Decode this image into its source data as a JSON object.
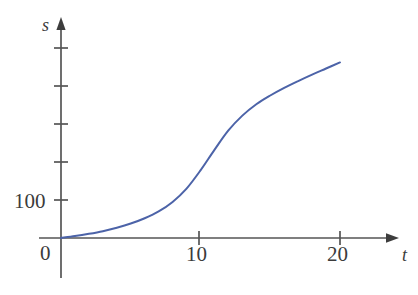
{
  "figure": {
    "background_color": "#ffffff",
    "width": 418,
    "height": 295
  },
  "axes": {
    "x_axis_name": "t",
    "y_axis_name": "s",
    "origin_label": "0",
    "axis_color": "#555555",
    "x_tick_labels": [
      "10",
      "20"
    ],
    "y_tick_labels": [
      "100"
    ]
  },
  "chart_data": {
    "type": "line",
    "title": "",
    "subtitle": "",
    "xlabel": "t",
    "ylabel": "s",
    "xlim": [
      0,
      24
    ],
    "ylim": [
      0,
      560
    ],
    "grid": false,
    "legend": null,
    "series": [
      {
        "name": "s(t)",
        "color": "#4c63a8",
        "line_width": 2,
        "x": [
          0,
          1,
          2,
          3,
          4,
          5,
          6,
          7,
          8,
          9,
          10,
          11,
          12,
          13,
          14,
          15,
          16,
          17,
          18,
          19,
          20
        ],
        "y": [
          0,
          5,
          11,
          18,
          27,
          38,
          52,
          70,
          95,
          130,
          178,
          232,
          283,
          322,
          352,
          375,
          395,
          413,
          430,
          446,
          462
        ]
      }
    ],
    "x_ticks": [
      10,
      20
    ],
    "y_ticks": [
      100,
      200,
      300,
      400,
      500
    ],
    "y_ticks_labeled": [
      100
    ],
    "annotations": []
  }
}
